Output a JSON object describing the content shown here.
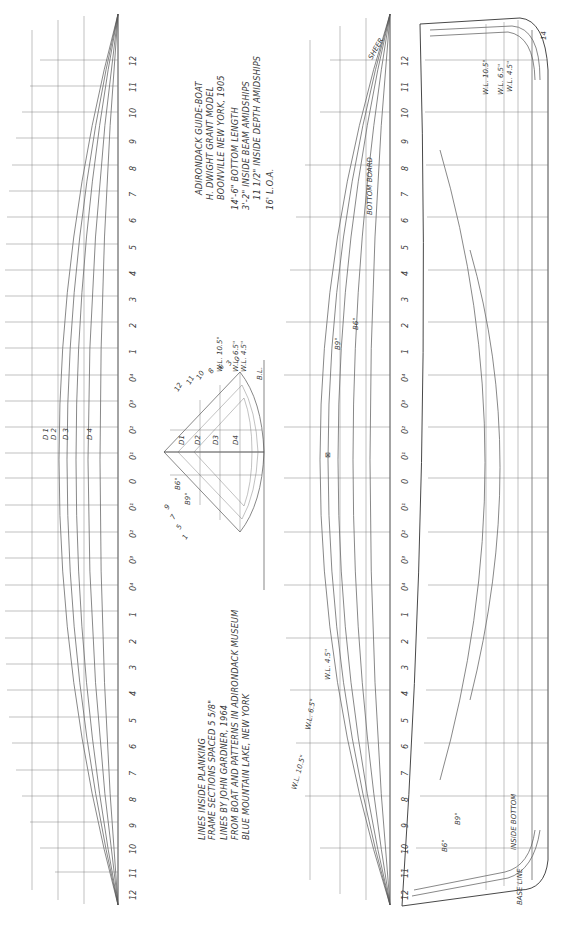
{
  "title_block": {
    "line1": "ADIRONDACK GUIDE-BOAT",
    "line2": "H. DWIGHT GRANT MODEL",
    "line3": "BOONVILLE NEW YORK, 1905",
    "line4": "14'-6\" BOTTOM LENGTH",
    "line5": "3'-2\" INSIDE BEAM AMIDSHIPS",
    "line6": "11 1/2\" INSIDE DEPTH AMIDSHIPS",
    "line7": "16' L.O.A."
  },
  "notes_block": {
    "line1": "LINES INSIDE PLANKING",
    "line2": "FRAME SECTIONS SPACED 5 5/8\"",
    "line3": "LINES BY JOHN GARDNER, 1964",
    "line4": "FROM BOAT AND PATTERNS IN ADIRONDACK MUSEUM",
    "line5": "BLUE MOUNTAIN LAKE, NEW YORK"
  },
  "stations": [
    "12",
    "11",
    "10",
    "9",
    "8",
    "7",
    "6",
    "5",
    "4",
    "3",
    "2",
    "1",
    "0⁴",
    "0³",
    "0²",
    "0¹",
    "0",
    "0¹",
    "0²",
    "0³",
    "0⁴",
    "1",
    "2",
    "3",
    "4",
    "5",
    "6",
    "7",
    "8",
    "9",
    "10",
    "11",
    "12"
  ],
  "diagonals": [
    "D 1",
    "D 2",
    "D 3",
    "D 4"
  ],
  "body_plan": {
    "station_labels_top": [
      "12",
      "11",
      "10",
      "8",
      "6",
      "3",
      "0"
    ],
    "station_labels_bottom": [
      "1",
      "5",
      "7",
      "9"
    ],
    "diagonal_labels": [
      "D1",
      "D2",
      "D3",
      "D4"
    ],
    "buttock_labels": [
      "B6\"",
      "B9\""
    ],
    "waterline_labels": [
      "W.L. 10.5\"",
      "W.L. 6.5\"",
      "W.L. 4.5\""
    ],
    "baseline_label": "B.L."
  },
  "half_breadth_plan": {
    "sheer_label": "SHEER",
    "bottom_board_label": "BOTTOM BOARD",
    "buttock_labels": [
      "B9\"",
      "B6\""
    ],
    "waterline_labels": [
      "W.L. 4.5\"",
      "W.L. 6.5\"",
      "W.L. 10.5\""
    ],
    "station_marker": "⊠"
  },
  "profile_plan": {
    "waterline_labels": [
      "W.L. 10.5\"",
      "W.L. 6.5\"",
      "W.L. 4.5\""
    ],
    "buttock_labels": [
      "B9\"",
      "B6\""
    ],
    "inside_bottom_label": "INSIDE BOTTOM",
    "base_line_label": "BASE LINE",
    "corner_label": "14"
  },
  "colors": {
    "paper": "#ffffff",
    "ink": "#3a3a3a"
  }
}
